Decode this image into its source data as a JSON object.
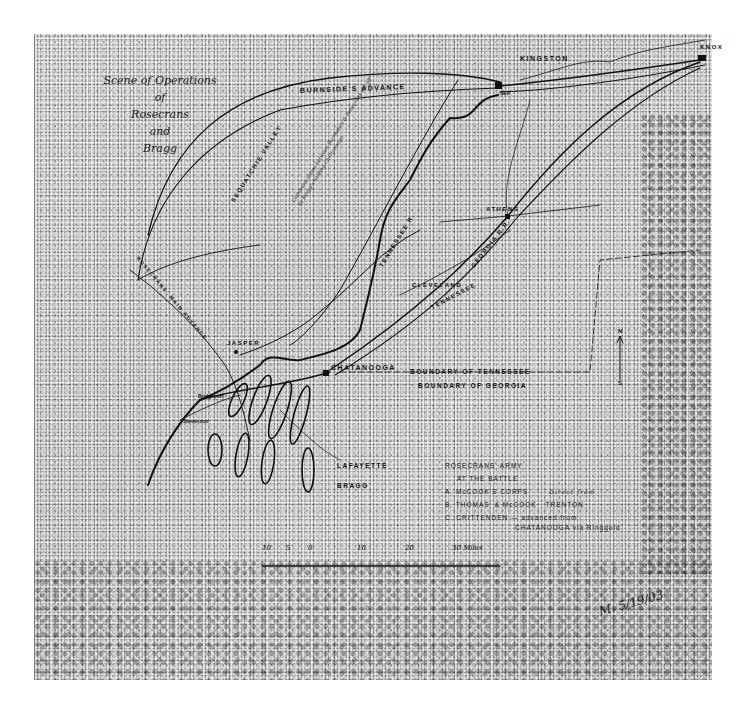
{
  "map": {
    "title": {
      "line1": "Scene of Operations",
      "line2": "of",
      "line3": "Rosecrans",
      "line4": "and",
      "line5": "Bragg"
    },
    "places": {
      "kingston": "KINGSTON",
      "knoxville": "KNOX",
      "athens": "ATHENS",
      "cleveland": "CLEVELAND",
      "jasper": "JASPER",
      "chattanooga": "CHATANOOGA",
      "bridgeport": "Bridgeport",
      "stevenson": "Stevenson",
      "lafayette": "LAFAYETTE",
      "bragg": "BRAGG"
    },
    "routes": {
      "burnside": "BURNSIDE'S ADVANCE",
      "sequatchie": "SEQUATCHIE VALLEY",
      "sequatchie_note": "Communications between Burnside's & Rosecrans cut off by Bragg's holding Chattanooga",
      "tennessee_river": "TENNESSEE R.",
      "rosecrans_main_advance": "ROSECRANS' MAIN ADVANCE",
      "ga_railroad": "GEORGIA R.R.",
      "tenn_railroad": "TENNESSEE",
      "sep": "SEP."
    },
    "boundaries": {
      "tennessee": "BOUNDARY OF TENNESSEE",
      "georgia": "BOUNDARY OF GEORGIA"
    },
    "compass": {
      "north": "N",
      "south": "S"
    },
    "legend": {
      "title": "ROSECRANS' ARMY",
      "subtitle": "AT THE BATTLE",
      "items": [
        {
          "key": "A.",
          "text": "McCOOK'S CORPS",
          "note": "Direct from"
        },
        {
          "key": "B.",
          "text": "THOMAS' & McCOOK",
          "note": "TRENTON"
        },
        {
          "key": "C.",
          "text": "CRITTENDEN — advanced from",
          "note": "CHATANOOGA via Ringgold"
        }
      ]
    },
    "scale": {
      "ticks": [
        "10",
        "5",
        "0",
        "10",
        "20",
        "30 Miles"
      ]
    },
    "signature": "M. 5/19/03"
  }
}
